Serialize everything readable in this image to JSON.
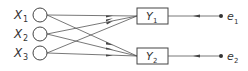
{
  "diagram": {
    "inputs": [
      {
        "label": "X",
        "sub": "1"
      },
      {
        "label": "X",
        "sub": "2"
      },
      {
        "label": "X",
        "sub": "3"
      }
    ],
    "outputs": [
      {
        "label": "Y",
        "sub": "1"
      },
      {
        "label": "Y",
        "sub": "2"
      }
    ],
    "errors": [
      {
        "label": "e",
        "sub": "1"
      },
      {
        "label": "e",
        "sub": "2"
      }
    ],
    "edges": [
      {
        "from": "X1",
        "to": "Y1"
      },
      {
        "from": "X1",
        "to": "Y2"
      },
      {
        "from": "X2",
        "to": "Y1"
      },
      {
        "from": "X2",
        "to": "Y2"
      },
      {
        "from": "X3",
        "to": "Y1"
      },
      {
        "from": "X3",
        "to": "Y2"
      },
      {
        "from": "e1",
        "to": "Y1"
      },
      {
        "from": "e2",
        "to": "Y2"
      }
    ],
    "line_color": "#444444"
  }
}
